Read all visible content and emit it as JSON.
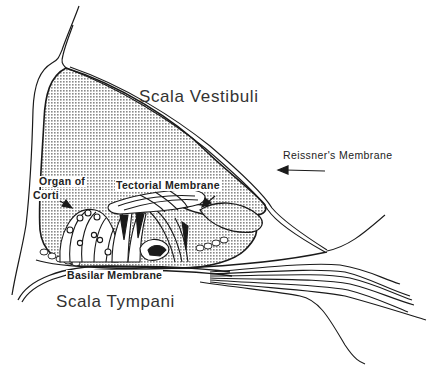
{
  "diagram": {
    "labels": {
      "scala_vestibuli": "Scala Vestibuli",
      "reissners_membrane": "Reissner's Membrane",
      "organ_of_corti_line1": "Organ of",
      "organ_of_corti_line2": "Corti",
      "tectorial_membrane": "Tectorial Membrane",
      "basilar_membrane": "Basilar Membrane",
      "scala_tympani": "Scala Tympani"
    },
    "colors": {
      "ink": "#1a1a1a",
      "stipple": "#9a9a9a",
      "background": "#ffffff"
    }
  }
}
